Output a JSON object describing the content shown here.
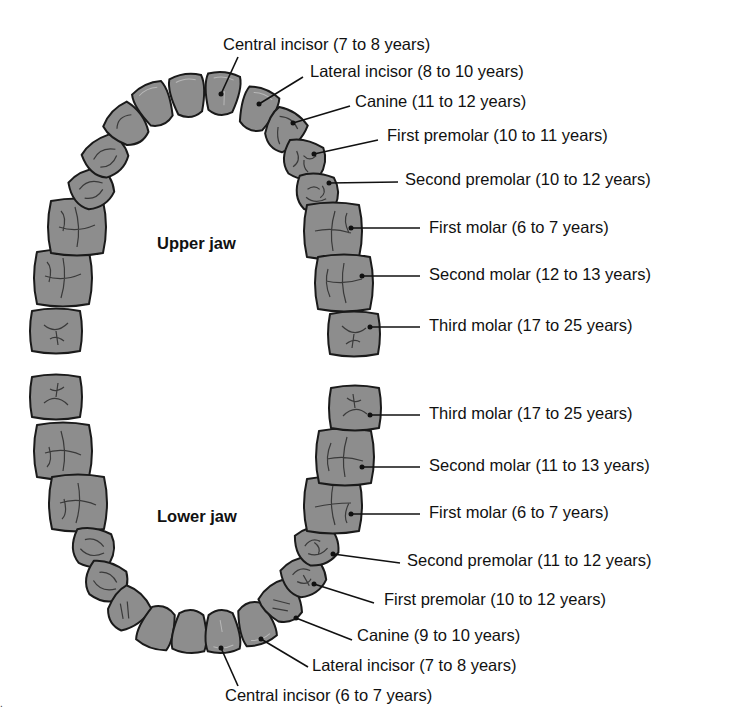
{
  "upper_jaw": {
    "title": "Upper jaw",
    "labels": [
      {
        "tooth": "Central incisor",
        "age": "7 to 8 years",
        "text": "Central incisor (7 to 8 years)"
      },
      {
        "tooth": "Lateral incisor",
        "age": "8 to 10 years",
        "text": "Lateral incisor (8 to 10 years)"
      },
      {
        "tooth": "Canine",
        "age": "11 to 12 years",
        "text": "Canine (11 to 12 years)"
      },
      {
        "tooth": "First premolar",
        "age": "10 to 11 years",
        "text": "First premolar (10 to 11 years)"
      },
      {
        "tooth": "Second premolar",
        "age": "10 to 12 years",
        "text": "Second premolar (10 to 12 years)"
      },
      {
        "tooth": "First molar",
        "age": "6 to 7 years",
        "text": "First molar (6 to 7 years)"
      },
      {
        "tooth": "Second molar",
        "age": "12 to 13 years",
        "text": "Second molar (12 to 13 years)"
      },
      {
        "tooth": "Third molar",
        "age": "17 to 25 years",
        "text": "Third molar (17 to 25 years)"
      }
    ]
  },
  "lower_jaw": {
    "title": "Lower jaw",
    "labels": [
      {
        "tooth": "Third molar",
        "age": "17 to 25 years",
        "text": "Third molar (17 to 25 years)"
      },
      {
        "tooth": "Second molar",
        "age": "11 to 13 years",
        "text": "Second molar (11 to 13 years)"
      },
      {
        "tooth": "First molar",
        "age": "6 to 7 years",
        "text": "First molar (6 to 7 years)"
      },
      {
        "tooth": "Second premolar",
        "age": "11 to 12 years",
        "text": "Second premolar (11 to 12 years)"
      },
      {
        "tooth": "First premolar",
        "age": "10 to 12 years",
        "text": "First premolar (10 to 12 years)"
      },
      {
        "tooth": "Canine",
        "age": "9 to 10 years",
        "text": "Canine (9 to 10 years)"
      },
      {
        "tooth": "Lateral incisor",
        "age": "7 to 8 years",
        "text": "Lateral incisor (7 to 8 years)"
      },
      {
        "tooth": "Central incisor",
        "age": "6 to 7 years",
        "text": "Central incisor (6 to 7 years)"
      }
    ]
  },
  "colors": {
    "tooth_fill": "#8d8d8d",
    "tooth_outline": "#1a1a1a",
    "text": "#111111",
    "background": "#ffffff"
  }
}
